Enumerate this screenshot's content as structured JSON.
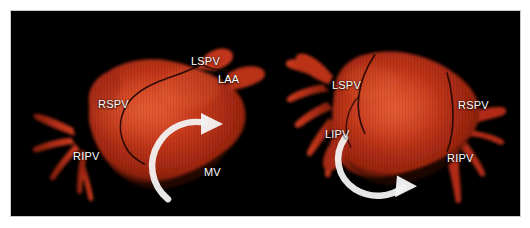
{
  "figure": {
    "background_color": "#ffffff",
    "panel_background_color": "#000000",
    "border_color": "#c9c9cc",
    "modality": "3D electroanatomic reconstruction of the left atrium",
    "tissue_color": "#bf3318",
    "tissue_highlight_color": "#e0512c",
    "tissue_shadow_color": "#5e1408",
    "lesion_line_color": "#2a0804",
    "annotation_color": "#ffffff"
  },
  "panels": [
    {
      "id": "panel-left",
      "name": "left-atrium-anterior-view",
      "labels": [
        {
          "id": "lspv",
          "text": "LSPV",
          "x": 180,
          "y": 44
        },
        {
          "id": "laa",
          "text": "LAA",
          "x": 207,
          "y": 62
        },
        {
          "id": "rspv",
          "text": "RSPV",
          "x": 87,
          "y": 87
        },
        {
          "id": "ripv",
          "text": "RIPV",
          "x": 62,
          "y": 139
        },
        {
          "id": "mv",
          "text": "MV",
          "x": 193,
          "y": 155
        }
      ],
      "arrow": {
        "id": "rotation-arrow-left",
        "direction": "clockwise",
        "color": "#f2f2f2"
      }
    },
    {
      "id": "panel-right",
      "name": "left-atrium-posterior-view",
      "labels": [
        {
          "id": "lspv",
          "text": "LSPV",
          "x": 65,
          "y": 68
        },
        {
          "id": "lipv",
          "text": "LIPV",
          "x": 58,
          "y": 117
        },
        {
          "id": "rspv",
          "text": "RSPV",
          "x": 191,
          "y": 88
        },
        {
          "id": "ripv",
          "text": "RIPV",
          "x": 180,
          "y": 141
        }
      ],
      "arrow": {
        "id": "rotation-arrow-right",
        "direction": "counter-clockwise",
        "color": "#f2f2f2"
      }
    }
  ],
  "legend": {
    "abbreviations": [
      {
        "key": "LSPV",
        "meaning": "left superior pulmonary vein"
      },
      {
        "key": "LIPV",
        "meaning": "left inferior pulmonary vein"
      },
      {
        "key": "RSPV",
        "meaning": "right superior pulmonary vein"
      },
      {
        "key": "RIPV",
        "meaning": "right inferior pulmonary vein"
      },
      {
        "key": "LAA",
        "meaning": "left atrial appendage"
      },
      {
        "key": "MV",
        "meaning": "mitral valve"
      }
    ]
  }
}
